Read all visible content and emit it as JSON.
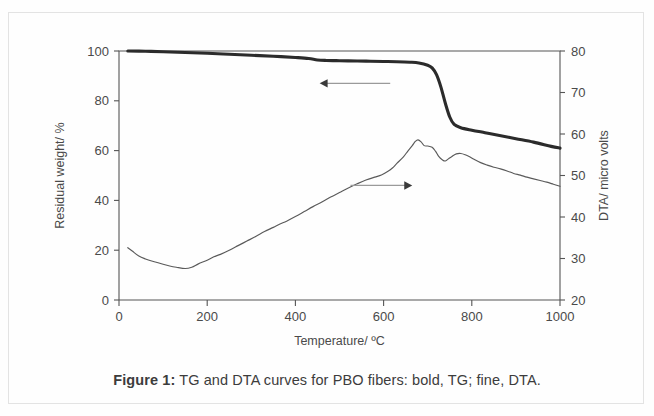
{
  "caption": {
    "label": "Figure 1:",
    "text": " TG and DTA curves for PBO fibers: bold, TG; fine, DTA."
  },
  "chart_data": {
    "type": "line",
    "title": "",
    "xlabel": "Temperature/ ºC",
    "ylabel": "Residual weight/ %",
    "y2label": "DTA/ micro volts",
    "xlim": [
      0,
      1000
    ],
    "ylim": [
      0,
      100
    ],
    "y2lim": [
      20,
      80
    ],
    "xticks": [
      0,
      200,
      400,
      600,
      800,
      1000
    ],
    "xtick_labels": [
      "0",
      "200",
      "400",
      "600",
      "800",
      "1000"
    ],
    "yticks": [
      0,
      20,
      40,
      60,
      80,
      100
    ],
    "ytick_labels": [
      "0",
      "20",
      "40",
      "60",
      "80",
      "100"
    ],
    "y2ticks": [
      20,
      30,
      40,
      50,
      60,
      70,
      80
    ],
    "y2tick_labels": [
      "20",
      "30",
      "40",
      "50",
      "60",
      "70",
      "80"
    ],
    "grid": false,
    "legend": "none",
    "annotations": [
      {
        "name": "tg-arrow",
        "direction": "left",
        "meaning": "TG curve reads on left axis",
        "x_start": 615,
        "x_end": 455,
        "y_value": 87
      },
      {
        "name": "dta-arrow",
        "direction": "right",
        "meaning": "DTA curve reads on right axis",
        "x_start": 525,
        "x_end": 665,
        "y_value": 46
      }
    ],
    "series": [
      {
        "name": "TG",
        "style": "bold",
        "axis": "left",
        "unit": "%",
        "x": [
          20,
          60,
          100,
          150,
          200,
          250,
          300,
          350,
          400,
          430,
          450,
          470,
          500,
          540,
          570,
          600,
          630,
          660,
          680,
          700,
          710,
          720,
          730,
          740,
          750,
          760,
          775,
          800,
          830,
          860,
          900,
          940,
          980,
          1000
        ],
        "y": [
          100,
          99.9,
          99.7,
          99.4,
          99.1,
          98.7,
          98.3,
          97.9,
          97.4,
          97.0,
          96.4,
          96.2,
          96.1,
          96.0,
          95.9,
          95.8,
          95.7,
          95.5,
          95.2,
          94.3,
          93.2,
          90.5,
          85.5,
          79.0,
          73.5,
          70.5,
          69.2,
          68.2,
          67.2,
          66.2,
          64.8,
          63.4,
          61.7,
          61.0
        ]
      },
      {
        "name": "DTA",
        "style": "fine",
        "axis": "right",
        "unit": "micro volts",
        "x": [
          20,
          30,
          45,
          60,
          80,
          100,
          115,
          130,
          150,
          165,
          180,
          200,
          215,
          230,
          250,
          270,
          290,
          310,
          330,
          350,
          365,
          380,
          400,
          420,
          440,
          460,
          480,
          500,
          520,
          540,
          560,
          580,
          595,
          610,
          620,
          630,
          645,
          655,
          665,
          672,
          678,
          685,
          692,
          700,
          710,
          718,
          725,
          733,
          740,
          748,
          755,
          765,
          775,
          785,
          795,
          805,
          820,
          835,
          850,
          865,
          880,
          895,
          910,
          925,
          940,
          955,
          970,
          985,
          1000
        ],
        "y": [
          32.6,
          31.8,
          30.6,
          29.9,
          29.2,
          28.6,
          28.2,
          27.9,
          27.6,
          27.9,
          28.7,
          29.6,
          30.4,
          31.0,
          32.0,
          33.1,
          34.2,
          35.3,
          36.5,
          37.5,
          38.3,
          39.0,
          40.1,
          41.3,
          42.5,
          43.6,
          44.8,
          45.9,
          47.0,
          48.0,
          48.9,
          49.6,
          50.1,
          51.0,
          51.8,
          52.9,
          54.5,
          55.9,
          57.2,
          58.2,
          58.6,
          58.1,
          57.2,
          57.1,
          56.8,
          55.8,
          54.6,
          53.8,
          53.5,
          54.1,
          54.6,
          55.2,
          55.3,
          55.0,
          54.5,
          53.9,
          53.1,
          52.5,
          52.0,
          51.6,
          51.1,
          50.5,
          50.1,
          49.6,
          49.2,
          48.8,
          48.4,
          47.9,
          47.4
        ]
      }
    ]
  }
}
